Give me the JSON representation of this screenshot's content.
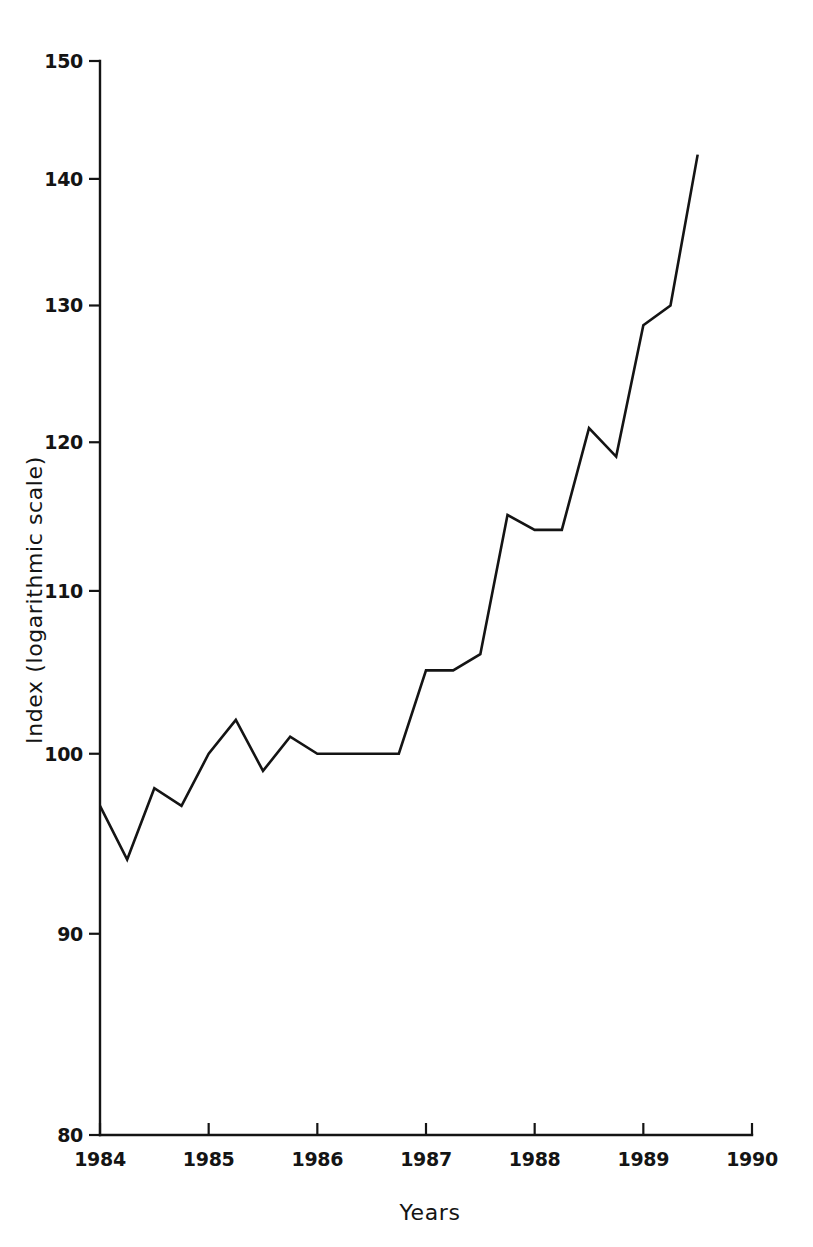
{
  "chart_data": {
    "type": "line",
    "title": "",
    "xlabel": "Years",
    "ylabel": "Index (logarithmic scale)",
    "yscale": "log",
    "ylim": [
      80,
      150
    ],
    "xlim": [
      1984,
      1990
    ],
    "grid": false,
    "legend": null,
    "y_ticks": [
      80,
      90,
      100,
      110,
      120,
      130,
      140,
      150
    ],
    "y_tick_labels": [
      "80",
      "90",
      "100",
      "110",
      "120",
      "130",
      "140",
      "150"
    ],
    "x_ticks": [
      1984,
      1985,
      1986,
      1987,
      1988,
      1989,
      1990
    ],
    "x_tick_labels": [
      "1984",
      "1985",
      "1986",
      "1987",
      "1988",
      "1989",
      "1990"
    ],
    "line_color": "#141414",
    "background_color": "#ffffff",
    "series": [
      {
        "name": "Index",
        "x": [
          1984.0,
          1984.25,
          1984.5,
          1984.75,
          1985.0,
          1985.25,
          1985.5,
          1985.75,
          1986.0,
          1986.25,
          1986.5,
          1986.75,
          1987.0,
          1987.25,
          1987.5,
          1987.75,
          1988.0,
          1988.25,
          1988.5,
          1988.75,
          1989.0,
          1989.25,
          1989.5
        ],
        "values": [
          97,
          94,
          98,
          97,
          100,
          102,
          99,
          101,
          100,
          100,
          100,
          100,
          105,
          105,
          106,
          115,
          114,
          114,
          121,
          119,
          128.5,
          130,
          142
        ]
      }
    ]
  }
}
